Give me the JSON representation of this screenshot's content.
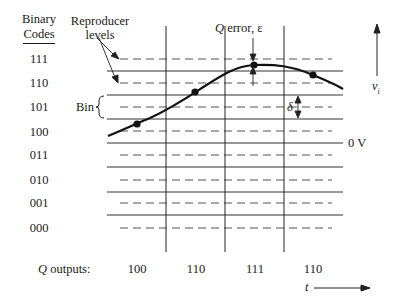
{
  "diagram": {
    "binary_codes_header_line1": "Binary",
    "binary_codes_header_line2": "Codes",
    "binary_codes": [
      "111",
      "110",
      "101",
      "100",
      "011",
      "010",
      "001",
      "000"
    ],
    "reproducer_label_line1": "Reproducer",
    "reproducer_label_line2": "levels",
    "bin_label": "Bin",
    "q_error_label_q": "Q",
    "q_error_label_rest": " error, ε",
    "delta_label": "δ",
    "zero_volt_label": "0 V",
    "vi_label_v": "v",
    "vi_label_sub": "i",
    "t_label": "t",
    "q_outputs_label_q": "Q",
    "q_outputs_label_rest": " outputs:",
    "q_outputs": [
      "100",
      "110",
      "111",
      "110"
    ],
    "colors": {
      "ink": "#1a1a1a",
      "dashed": "#555555",
      "solid": "#333333",
      "background": "#ffffff"
    }
  }
}
